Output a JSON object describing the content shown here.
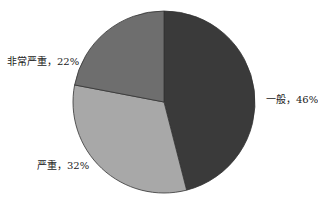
{
  "chart_data": {
    "type": "pie",
    "title": "",
    "start_angle": "12 o'clock",
    "direction": "clockwise",
    "categories": [
      "一般",
      "严重",
      "非常严重"
    ],
    "values": [
      46,
      32,
      22
    ],
    "unit": "%",
    "colors": [
      "#3a3a3a",
      "#a8a8a8",
      "#6e6e6e"
    ],
    "data_labels": [
      "一般，46%",
      "严重，32%",
      "非常严重，22%"
    ],
    "legend": "none",
    "geometry": {
      "cx": 164,
      "cy": 102,
      "r": 91
    }
  },
  "labels": {
    "slice0": "一般，46%",
    "slice1": "严重，32%",
    "slice2": "非常严重，22%"
  }
}
